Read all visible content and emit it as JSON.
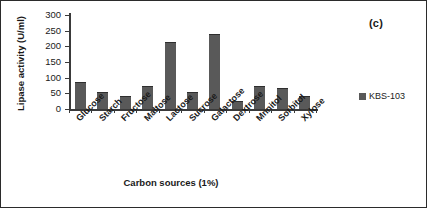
{
  "figure": {
    "panel_label": "(c)",
    "frame_color": "#2b2b2b"
  },
  "legend": {
    "position": "right",
    "entries": [
      {
        "label": "KBS-103",
        "color": "#595959"
      }
    ]
  },
  "chart_data": {
    "type": "bar",
    "title": "",
    "xlabel": "Carbon sources (1%)",
    "ylabel": "Lipase activity (U/ml)",
    "ylim": [
      0,
      300
    ],
    "yticks": [
      0,
      50,
      100,
      150,
      200,
      250,
      300
    ],
    "grid": false,
    "legend_position": "right",
    "bar_color": "#595959",
    "categories": [
      "Glucose",
      "Starch",
      "Fructose",
      "Maltose",
      "Lactose",
      "Sucrose",
      "Galactose",
      "Dextrose",
      "Mnnitol",
      "Sorbitol",
      "Xylose"
    ],
    "series": [
      {
        "name": "KBS-103",
        "values": [
          86,
          54,
          43,
          73,
          214,
          54,
          240,
          25,
          74,
          67,
          41
        ]
      }
    ]
  }
}
